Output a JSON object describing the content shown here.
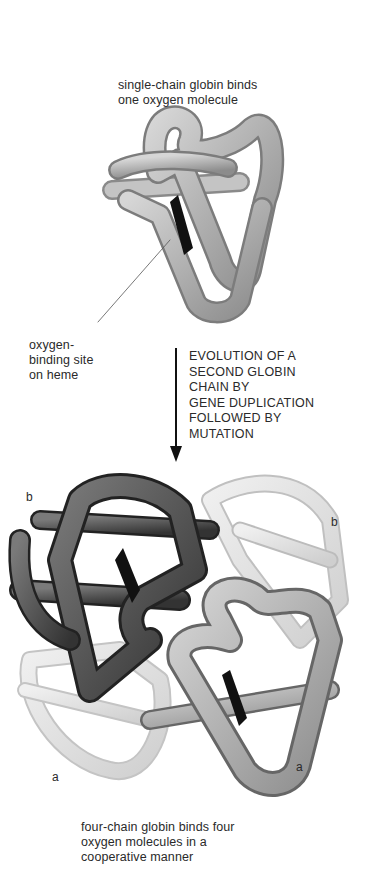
{
  "figure": {
    "top_caption": [
      "single-chain globin binds",
      "one oxygen molecule"
    ],
    "site_label": [
      "oxygen-",
      "binding site",
      "on heme"
    ],
    "process_label": [
      "EVOLUTION OF A",
      "SECOND GLOBIN",
      "CHAIN BY",
      "GENE DUPLICATION",
      "FOLLOWED BY",
      "MUTATION"
    ],
    "bottom_caption": [
      "four-chain globin binds four",
      "oxygen molecules in a",
      "cooperative manner"
    ],
    "chain_labels": {
      "b_left": "b",
      "b_right": "b",
      "a_left": "a",
      "a_right": "a"
    }
  },
  "colors": {
    "background": "#ffffff",
    "text": "#2a2a2a",
    "heme": "#111111",
    "chain_light": "#c8c8c8",
    "chain_mid": "#8a8a8a",
    "chain_dark": "#4a4a4a",
    "chain_pale": "#e4e4e4"
  }
}
